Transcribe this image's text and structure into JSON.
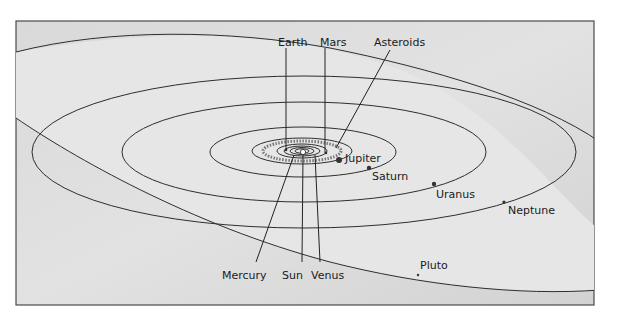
{
  "diagram": {
    "colors": {
      "background": "#ffffff",
      "panel": "#d6d6d6",
      "panel_light": "#e4e4e4",
      "line": "#2a2a2a"
    },
    "labels": {
      "earth": "Earth",
      "mars": "Mars",
      "asteroids": "Asteroids",
      "jupiter": "Jupiter",
      "saturn": "Saturn",
      "uranus": "Uranus",
      "neptune": "Neptune",
      "pluto": "Pluto",
      "mercury": "Mercury",
      "sun": "Sun",
      "venus": "Venus"
    }
  }
}
